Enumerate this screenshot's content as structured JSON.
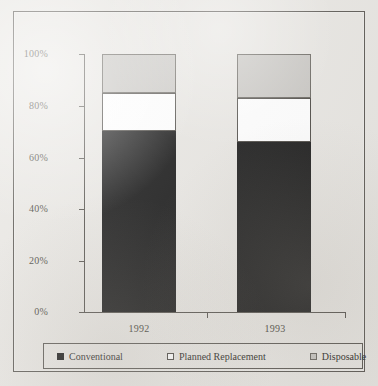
{
  "chart_data": {
    "type": "bar",
    "subtype": "stacked-percent",
    "title": "",
    "xlabel": "",
    "ylabel": "",
    "categories": [
      "1992",
      "1993"
    ],
    "series": [
      {
        "name": "Conventional",
        "values": [
          70,
          66
        ],
        "color": "#1b1b1b"
      },
      {
        "name": "Planned Replacement",
        "values": [
          15,
          17
        ],
        "color": "#ffffff"
      },
      {
        "name": "Disposable",
        "values": [
          15,
          17
        ],
        "color": "#c9c7c3"
      }
    ],
    "ylim": [
      0,
      100
    ],
    "yticks": [
      0,
      20,
      40,
      60,
      80,
      100
    ],
    "ytick_labels": [
      "0%",
      "20%",
      "40%",
      "60%",
      "80%",
      "100%"
    ],
    "grid": false,
    "legend_position": "bottom"
  },
  "axis": {
    "y_labels": [
      "100%",
      "80%",
      "60%",
      "40%",
      "20%",
      "0%"
    ],
    "x_labels": [
      "1992",
      "1993"
    ]
  },
  "legend": {
    "items": [
      {
        "label": "Conventional",
        "swatch": "filled-black-square-icon"
      },
      {
        "label": "Planned Replacement",
        "swatch": "outlined-white-square-icon"
      },
      {
        "label": "Disposable",
        "swatch": "filled-gray-square-icon"
      }
    ]
  },
  "colors": {
    "background": "#e9e7e3",
    "frame": "#5d5a55",
    "conventional": "#1b1b1b",
    "planned_replacement": "#ffffff",
    "disposable": "#c9c7c3",
    "text": "#2e2c28"
  }
}
